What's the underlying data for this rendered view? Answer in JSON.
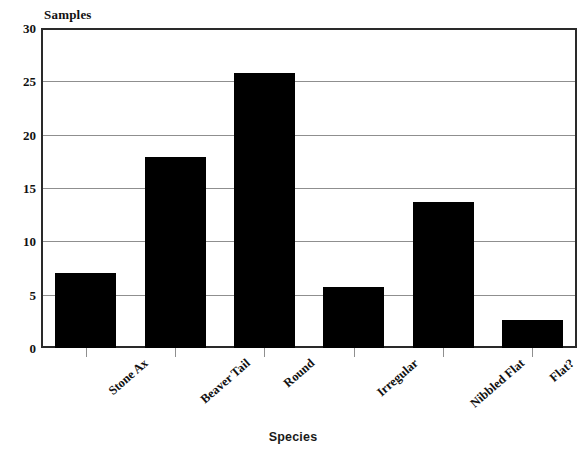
{
  "chart_data": {
    "type": "bar",
    "title": "",
    "xlabel": "Species",
    "ylabel": "Samples",
    "categories": [
      "Stone Ax",
      "Beaver Tail",
      "Round",
      "Irregular",
      "Nibbled Flat",
      "Flat?"
    ],
    "values": [
      7,
      17.9,
      25.8,
      5.7,
      13.7,
      2.6
    ],
    "ylim": [
      0,
      30
    ],
    "yticks": [
      0,
      5,
      10,
      15,
      20,
      25,
      30
    ],
    "ytick_labels": [
      "0",
      "5",
      "10",
      "15",
      "20",
      "25",
      "30"
    ],
    "grid": "horizontal",
    "legend": "none",
    "bar_color": "#000000",
    "frame_color": "#2a2a2a",
    "gridline_color": "#8f8f8f",
    "background_color": "#ffffff"
  }
}
